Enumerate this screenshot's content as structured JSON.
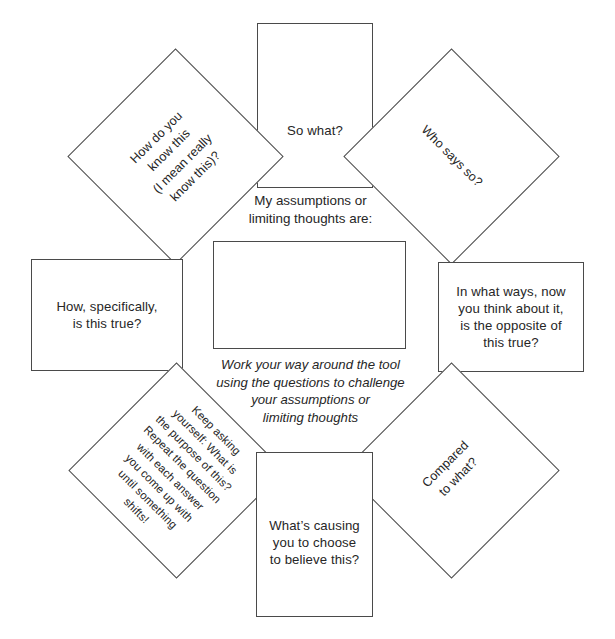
{
  "colors": {
    "stroke": "#4a4a4a",
    "text": "#262626",
    "background": "#ffffff"
  },
  "center": {
    "prompt": "My assumptions or\nlimiting thoughts are:",
    "answer_value": "",
    "instructions": "Work your way around the tool\nusing the questions to challenge\nyour assumptions or\nlimiting thoughts"
  },
  "boxes": {
    "top": {
      "name": "so-what",
      "text": "So what?"
    },
    "bottom": {
      "name": "whats-causing",
      "text": "What’s causing\nyou to choose\nto believe this?"
    },
    "left": {
      "name": "how-specifically",
      "text": "How, specifically,\nis this true?"
    },
    "right": {
      "name": "opposite-true",
      "text": "In what ways, now\nyou think about it,\nis the opposite of\nthis true?"
    }
  },
  "diamonds": {
    "top_left": {
      "name": "how-do-you-know",
      "text": "How do you\nknow this\n(I mean really\nknow this)?",
      "rotation_deg": -45
    },
    "top_right": {
      "name": "who-says-so",
      "text": "Who says so?",
      "rotation_deg": 45
    },
    "bottom_left": {
      "name": "keep-asking",
      "text": "Keep asking\nyourself: What is\nthe purpose of this?\nRepeat the question\nwith each answer\nyou come up with\nuntil something\nshifts!",
      "rotation_deg": 45
    },
    "bottom_right": {
      "name": "compared-to-what",
      "text": "Compared\nto what?",
      "rotation_deg": -45
    }
  }
}
